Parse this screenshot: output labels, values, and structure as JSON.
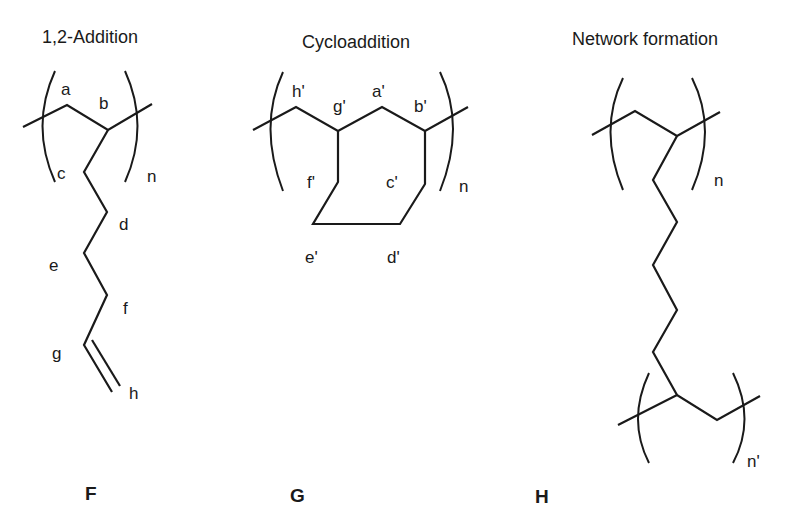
{
  "panels": [
    {
      "id": "F",
      "title": "1,2-Addition",
      "compound_label": "F",
      "atom_labels": [
        "a",
        "b",
        "c",
        "d",
        "e",
        "f",
        "g",
        "h"
      ],
      "repeat_subscript": "n"
    },
    {
      "id": "G",
      "title": "Cycloaddition",
      "compound_label": "G",
      "atom_labels": [
        "h'",
        "g'",
        "a'",
        "b'",
        "f'",
        "c'",
        "e'",
        "d'"
      ],
      "repeat_subscript": "n"
    },
    {
      "id": "H",
      "title": "Network formation",
      "compound_label": "H",
      "atom_labels": [],
      "repeat_subscript": "n",
      "repeat_subscript_2": "n'"
    }
  ]
}
